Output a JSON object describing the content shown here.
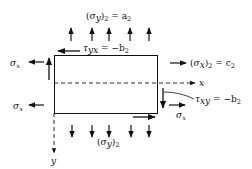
{
  "diagram": {
    "type": "stress-element",
    "labels": {
      "top_load": "(σ_y)₂ = a₂",
      "top_load_sym": "σ",
      "top_load_sub": "y",
      "top_load_eq": " = a",
      "top_load_num": "2",
      "shear_top": "τ",
      "shear_top_sub": "yx",
      "shear_top_eq": " = −b",
      "shear_top_num": "2",
      "right_load": "σ",
      "right_load_sub": "x",
      "right_load_eq": " = c",
      "right_load_num": "2",
      "x_axis": "x",
      "y_axis": "y",
      "shear_right": "τ",
      "shear_right_sub": "xy",
      "shear_right_eq": " = −b",
      "shear_right_num": "2",
      "sigma_x_left_top": "σ",
      "sigma_x_left_top_sub": "x",
      "sigma_x_left_bottom": "σ",
      "sigma_x_left_bottom_sub": "x",
      "sigma_x_right_bottom": "σ",
      "sigma_x_right_bottom_sub": "x",
      "bottom_load": "σ",
      "bottom_load_sub": "y",
      "bottom_load_num": "2"
    },
    "arrows": {
      "top_up_count": 5,
      "bottom_down_count": 5
    },
    "colors": {
      "stroke": "#111111",
      "background": "#ffffff"
    }
  }
}
